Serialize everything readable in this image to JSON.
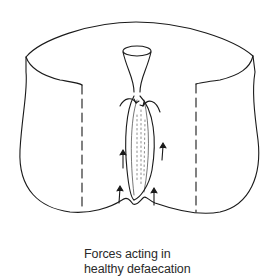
{
  "figure": {
    "caption_line1": "Forces acting in",
    "caption_line2": "healthy defaecation",
    "line_color": "#1a1a1a",
    "background": "#ffffff"
  }
}
